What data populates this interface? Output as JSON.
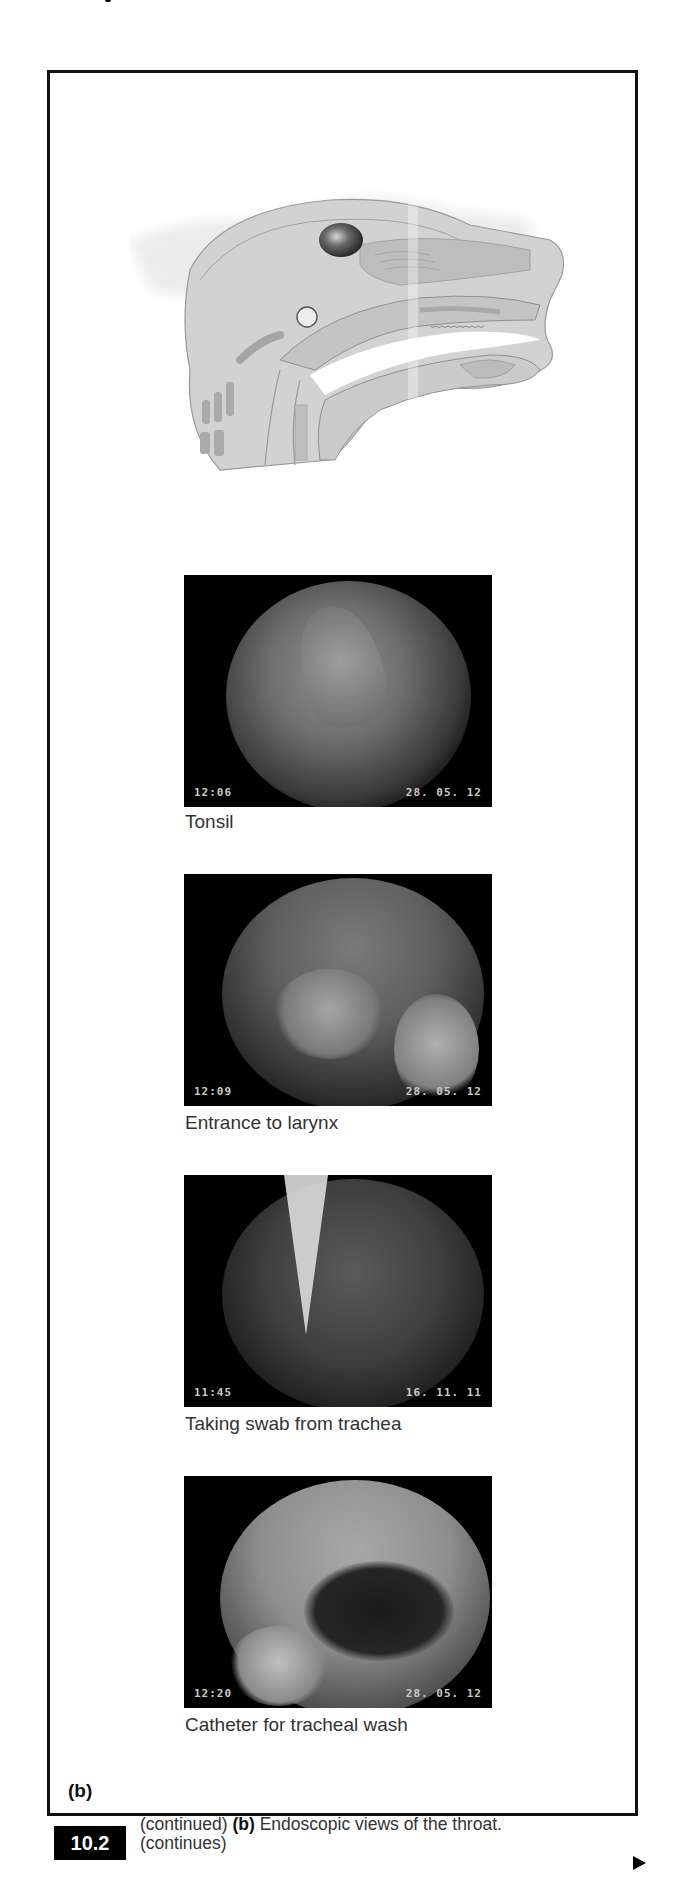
{
  "figure": {
    "panel_label": "(b)",
    "number": "10.2",
    "caption_prefix": "(continued)",
    "caption_bold": "(b)",
    "caption_text": "Endoscopic views of the throat.",
    "caption_suffix": "(continues)",
    "continue_icon": "triangle-right-icon"
  },
  "illustration": {
    "subject": "sagittal-section-rabbit-head",
    "marker": "circle-marker-at-pharynx"
  },
  "endoscopic_images": [
    {
      "caption": "Tonsil",
      "time": "12:06",
      "date": "28. 05. 12"
    },
    {
      "caption": "Entrance to larynx",
      "time": "12:09",
      "date": "28. 05. 12"
    },
    {
      "caption": "Taking swab from trachea",
      "time": "11:45",
      "date": "16. 11. 11"
    },
    {
      "caption": "Catheter for tracheal wash",
      "time": "12:20",
      "date": "28. 05. 12"
    }
  ],
  "colors": {
    "frame": "#111111",
    "label_bg": "#000000",
    "label_text": "#ffffff",
    "illustration_fill": "#cfcfcf",
    "illustration_dark": "#a9a9a9"
  }
}
